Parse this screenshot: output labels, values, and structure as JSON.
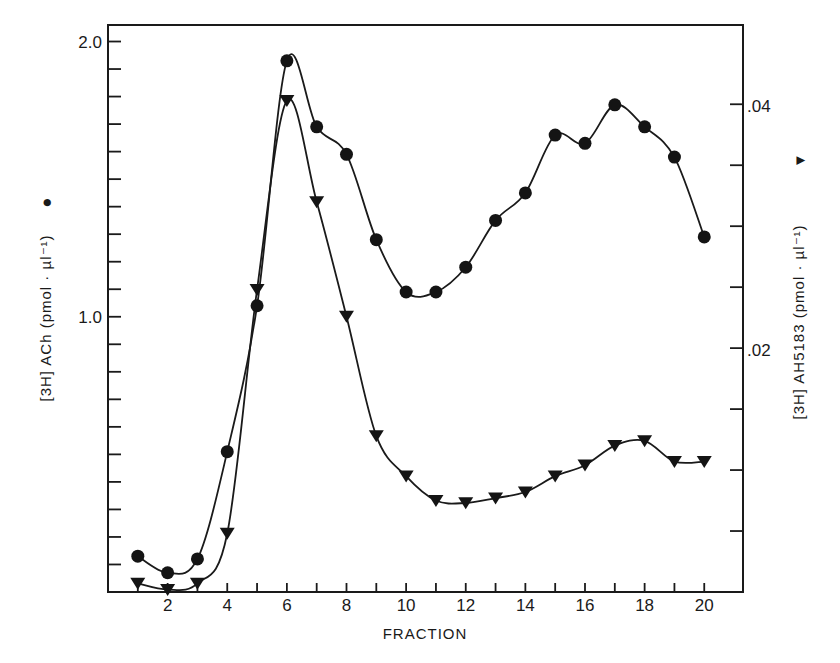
{
  "chart_data": {
    "type": "line",
    "title": "",
    "xlabel": "FRACTION",
    "ylabel_left": "[3H] ACh (pmol · µl⁻¹)",
    "ylabel_left_marker": "●",
    "ylabel_right": "[3H] AH5183 (pmol · µl⁻¹)",
    "ylabel_right_marker": "▼",
    "xlim": [
      0,
      21.3
    ],
    "ylim_left": [
      0,
      2.06
    ],
    "ylim_right": [
      0,
      0.0465
    ],
    "x_ticks": [
      1,
      2,
      3,
      4,
      5,
      6,
      7,
      8,
      9,
      10,
      11,
      12,
      13,
      14,
      15,
      16,
      17,
      18,
      19,
      20
    ],
    "x_tick_labels": [
      "2",
      "4",
      "6",
      "8",
      "10",
      "12",
      "14",
      "16",
      "18",
      "20"
    ],
    "x_tick_label_values": [
      2,
      4,
      6,
      8,
      10,
      12,
      14,
      16,
      18,
      20
    ],
    "y_left_ticks": [
      0.1,
      0.2,
      0.3,
      0.4,
      0.5,
      0.6,
      0.7,
      0.8,
      0.9,
      1.0,
      1.1,
      1.2,
      1.3,
      1.4,
      1.5,
      1.6,
      1.7,
      1.8,
      1.9,
      2.0
    ],
    "y_left_tick_labels": [
      {
        "value": 1.0,
        "label": "1.0"
      },
      {
        "value": 2.0,
        "label": "2.0"
      }
    ],
    "y_right_ticks": [
      0.005,
      0.01,
      0.015,
      0.02,
      0.025,
      0.03,
      0.035,
      0.04
    ],
    "y_right_tick_labels": [
      {
        "value": 0.02,
        "label": ".02"
      },
      {
        "value": 0.04,
        "label": ".04"
      }
    ],
    "grid": false,
    "x": [
      1,
      2,
      3,
      4,
      5,
      6,
      7,
      8,
      9,
      10,
      11,
      12,
      13,
      14,
      15,
      16,
      17,
      18,
      19,
      20
    ],
    "series": [
      {
        "name": "[3H] ACh",
        "axis": "left",
        "marker": "circle",
        "values": [
          0.13,
          0.07,
          0.12,
          0.51,
          1.04,
          1.93,
          1.69,
          1.59,
          1.28,
          1.09,
          1.09,
          1.18,
          1.35,
          1.45,
          1.66,
          1.63,
          1.77,
          1.69,
          1.58,
          1.29
        ]
      },
      {
        "name": "[3H] AH5183",
        "axis": "right",
        "marker": "triangle-down",
        "values": [
          0.0007,
          0.0002,
          0.0007,
          0.0048,
          0.0248,
          0.0403,
          0.032,
          0.0226,
          0.0128,
          0.0095,
          0.0075,
          0.0073,
          0.0077,
          0.0082,
          0.0095,
          0.0104,
          0.012,
          0.0124,
          0.0107,
          0.0107
        ]
      }
    ]
  }
}
